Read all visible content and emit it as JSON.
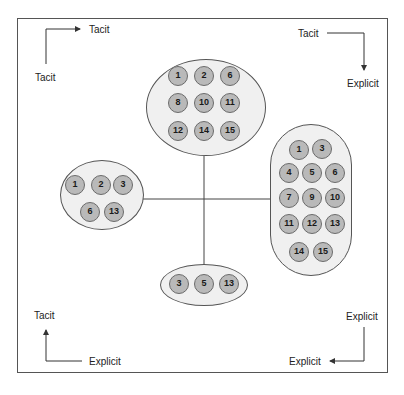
{
  "corners": {
    "top_left": {
      "start_label": "Tacit",
      "end_label": "Tacit"
    },
    "top_right": {
      "start_label": "Tacit",
      "end_label": "Explicit"
    },
    "bottom_left": {
      "start_label": "Explicit",
      "end_label": "Tacit"
    },
    "bottom_right": {
      "start_label": "Explicit",
      "end_label": "Explicit"
    }
  },
  "clusters": {
    "top": {
      "nodes": [
        "1",
        "2",
        "6",
        "8",
        "10",
        "11",
        "12",
        "14",
        "15"
      ]
    },
    "left": {
      "nodes": [
        "1",
        "2",
        "3",
        "6",
        "13"
      ]
    },
    "right": {
      "nodes": [
        "1",
        "3",
        "4",
        "5",
        "6",
        "7",
        "9",
        "10",
        "11",
        "12",
        "13",
        "14",
        "15"
      ]
    },
    "bottom": {
      "nodes": [
        "3",
        "5",
        "13"
      ]
    }
  },
  "colors": {
    "node_fill": "#b9b9b9",
    "node_border": "#6b6b6b",
    "cluster_fill": "#f0f0f0",
    "line": "#444444"
  }
}
